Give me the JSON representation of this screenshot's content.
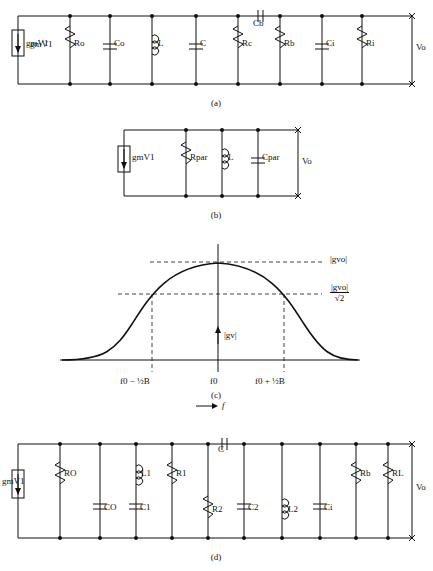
{
  "figure": {
    "panels": [
      {
        "id": "a",
        "caption": "(a)"
      },
      {
        "id": "b",
        "caption": "(b)"
      },
      {
        "id": "c",
        "caption": "(c)"
      },
      {
        "id": "d",
        "caption": "(d)"
      }
    ]
  },
  "panel_a": {
    "caption": "(a)",
    "source_label": "gmV1",
    "source_label_sub": "m",
    "source_label_sub2": "1",
    "components": [
      {
        "name": "R_o",
        "label": "Ro",
        "sub": "o",
        "type": "resistor"
      },
      {
        "name": "C_o",
        "label": "Co",
        "sub": "o",
        "type": "capacitor"
      },
      {
        "name": "L",
        "label": "L",
        "sub": "",
        "type": "inductor"
      },
      {
        "name": "C",
        "label": "C",
        "sub": "",
        "type": "capacitor"
      },
      {
        "name": "R_c",
        "label": "Rc",
        "sub": "c",
        "type": "resistor"
      },
      {
        "name": "R_b",
        "label": "Rb",
        "sub": "b",
        "type": "resistor"
      },
      {
        "name": "C_b",
        "label": "Cb",
        "sub": "b",
        "type": "capacitor-series"
      },
      {
        "name": "C_i",
        "label": "Ci",
        "sub": "i",
        "type": "capacitor"
      },
      {
        "name": "R_i",
        "label": "Ri",
        "sub": "i",
        "type": "resistor"
      }
    ],
    "output_label": "Vo",
    "output_sub": "o"
  },
  "panel_b": {
    "caption": "(b)",
    "source_label": "gmV1",
    "components": [
      {
        "name": "R_par",
        "label": "Rpar",
        "sub": "par",
        "type": "resistor"
      },
      {
        "name": "L",
        "label": "L",
        "sub": "",
        "type": "inductor"
      },
      {
        "name": "C_par",
        "label": "Cpar",
        "sub": "par",
        "type": "capacitor"
      }
    ],
    "output_label": "Vo",
    "output_sub": "o"
  },
  "panel_c": {
    "caption": "(c)",
    "y_labels": [
      {
        "text": "|gvo|",
        "sub": "vo"
      },
      {
        "text": "|gvo|/√2",
        "sub": "vo"
      }
    ],
    "peak_label": "|gvo|",
    "peak_sub": "vo",
    "half_power_num": "|gvo|",
    "half_power_den": "√2",
    "axis_vert_label": "|gv|",
    "axis_vert_sub": "v",
    "x_ticks": [
      {
        "text": "f0 − ½B"
      },
      {
        "text": "f0"
      },
      {
        "text": "f0 + ½B"
      }
    ],
    "x_axis_label": "f",
    "x_axis_arrow": "⟶"
  },
  "panel_d": {
    "caption": "(d)",
    "source_label": "gmV1",
    "components": [
      {
        "name": "R_O",
        "label": "RO",
        "sub": "O",
        "type": "resistor"
      },
      {
        "name": "C_O",
        "label": "CO",
        "sub": "O",
        "type": "capacitor"
      },
      {
        "name": "L_1",
        "label": "L1",
        "sub": "1",
        "type": "inductor"
      },
      {
        "name": "C_1",
        "label": "C1",
        "sub": "1",
        "type": "capacitor"
      },
      {
        "name": "R_1",
        "label": "R1",
        "sub": "1",
        "type": "resistor"
      },
      {
        "name": "R_2",
        "label": "R2",
        "sub": "2",
        "type": "resistor"
      },
      {
        "name": "C",
        "label": "C",
        "sub": "",
        "type": "capacitor-series"
      },
      {
        "name": "C_2",
        "label": "C2",
        "sub": "2",
        "type": "capacitor"
      },
      {
        "name": "L_2",
        "label": "L2",
        "sub": "2",
        "type": "inductor"
      },
      {
        "name": "R_b",
        "label": "Rb",
        "sub": "b",
        "type": "resistor"
      },
      {
        "name": "C_i",
        "label": "Ci",
        "sub": "i",
        "type": "capacitor"
      },
      {
        "name": "R_L",
        "label": "RL",
        "sub": "L",
        "type": "resistor"
      }
    ],
    "output_label": "Vo",
    "output_sub": "o"
  }
}
